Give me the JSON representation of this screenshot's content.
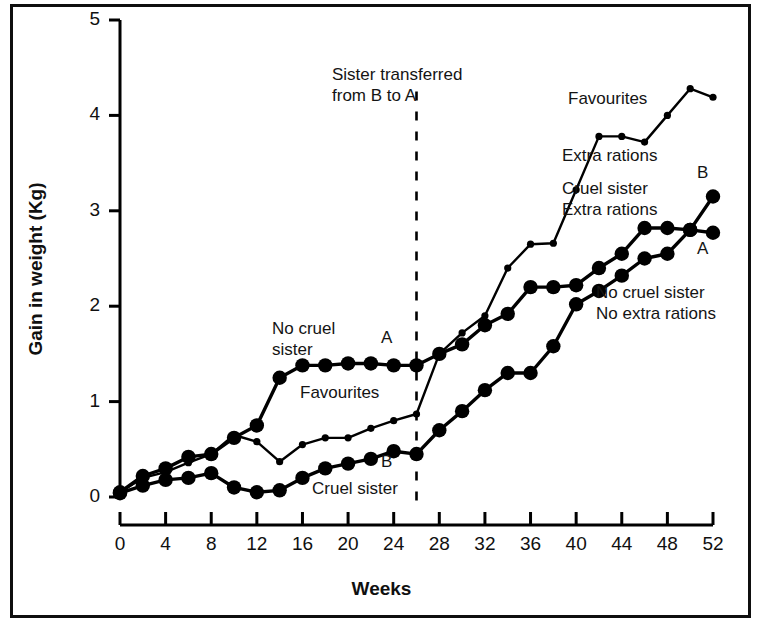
{
  "chart_data": {
    "type": "line",
    "title": "",
    "xlabel": "Weeks",
    "ylabel": "Gain in weight (Kg)",
    "xlim": [
      0,
      52
    ],
    "ylim": [
      0,
      5
    ],
    "xticks": [
      0,
      4,
      8,
      12,
      16,
      20,
      24,
      28,
      32,
      36,
      40,
      44,
      48,
      52
    ],
    "yticks": [
      0,
      1,
      2,
      3,
      4,
      5
    ],
    "grid": false,
    "legend_position": "inline-annotations",
    "marker_color": "#000000",
    "line_color": "#000000",
    "series": [
      {
        "name": "Favourites / Extra rations",
        "marker": "small-dot",
        "x": [
          0,
          2,
          4,
          6,
          8,
          10,
          12,
          14,
          16,
          18,
          20,
          22,
          24,
          26,
          28,
          30,
          32,
          34,
          36,
          38,
          40,
          42,
          44,
          46,
          48,
          50,
          52
        ],
        "y": [
          0.05,
          0.2,
          0.26,
          0.36,
          0.45,
          0.65,
          0.58,
          0.37,
          0.55,
          0.62,
          0.62,
          0.72,
          0.8,
          0.87,
          1.5,
          1.72,
          1.9,
          2.4,
          2.65,
          2.66,
          3.22,
          3.78,
          3.78,
          3.72,
          4.0,
          4.28,
          4.19
        ]
      },
      {
        "name": "A — No cruel sister (then cruel sister, extra rations)",
        "marker": "large-dot",
        "endpoint_label": "A",
        "x": [
          0,
          2,
          4,
          6,
          8,
          10,
          12,
          14,
          16,
          18,
          20,
          22,
          24,
          26,
          28,
          30,
          32,
          34,
          36,
          38,
          40,
          42,
          44,
          46,
          48,
          50,
          52
        ],
        "y": [
          0.05,
          0.22,
          0.3,
          0.42,
          0.45,
          0.62,
          0.75,
          1.25,
          1.38,
          1.38,
          1.4,
          1.4,
          1.38,
          1.38,
          1.5,
          1.6,
          1.8,
          1.92,
          2.2,
          2.2,
          2.22,
          2.4,
          2.55,
          2.82,
          2.82,
          2.8,
          2.77
        ]
      },
      {
        "name": "B — Cruel sister (then no cruel sister, no extra rations)",
        "marker": "large-dot",
        "endpoint_label": "B",
        "x": [
          0,
          2,
          4,
          6,
          8,
          10,
          12,
          14,
          16,
          18,
          20,
          22,
          24,
          26,
          28,
          30,
          32,
          34,
          36,
          38,
          40,
          42,
          44,
          46,
          48,
          50,
          52
        ],
        "y": [
          0.04,
          0.12,
          0.18,
          0.2,
          0.25,
          0.1,
          0.05,
          0.07,
          0.2,
          0.3,
          0.35,
          0.4,
          0.48,
          0.45,
          0.7,
          0.9,
          1.12,
          1.3,
          1.3,
          1.58,
          2.02,
          2.16,
          2.32,
          2.5,
          2.55,
          2.8,
          3.15
        ]
      }
    ],
    "annotations": [
      {
        "id": "transfer-note",
        "text": "Sister transferred\nfrom B to A",
        "x": 26,
        "y": 4.6
      },
      {
        "id": "no-cruel-sister",
        "text": "No cruel\nsister",
        "x": 15,
        "y": 1.75
      },
      {
        "id": "favourites-left",
        "text": "Favourites",
        "x": 17.5,
        "y": 1.05
      },
      {
        "id": "cruel-sister-left",
        "text": "Cruel sister",
        "x": 20,
        "y": 0.1
      },
      {
        "id": "favourites-right",
        "text": "Favourites",
        "x": 41,
        "y": 4.05
      },
      {
        "id": "extra-rations-right",
        "text": "Extra rations",
        "x": 41,
        "y": 3.45
      },
      {
        "id": "cruel-sister-extra-rations",
        "text": "Cruel sister\nExtra rations",
        "x": 41,
        "y": 3.05
      },
      {
        "id": "no-cruel-no-extra",
        "text": "No cruel sister\nNo extra rations",
        "x": 41,
        "y": 1.85
      }
    ],
    "reference_lines": [
      {
        "id": "transfer-line",
        "orientation": "vertical",
        "x": 26,
        "style": "dashed",
        "color": "#000000"
      }
    ],
    "point_labels": [
      {
        "id": "label-A-mid",
        "text": "A",
        "x": 24.4,
        "y": 1.62
      },
      {
        "id": "label-B-mid",
        "text": "B",
        "x": 24.4,
        "y": 0.25
      },
      {
        "id": "label-B-end",
        "text": "B",
        "x": 52.2,
        "y": 3.45
      },
      {
        "id": "label-A-end",
        "text": "A",
        "x": 52.2,
        "y": 2.45
      }
    ]
  },
  "axis": {
    "y_title": "Gain in weight (Kg)",
    "x_title": "Weeks",
    "y_tick_labels": [
      "0",
      "1",
      "2",
      "3",
      "4",
      "5"
    ],
    "x_tick_labels": [
      "0",
      "4",
      "8",
      "12",
      "16",
      "20",
      "24",
      "28",
      "32",
      "36",
      "40",
      "44",
      "48",
      "52"
    ]
  },
  "annotations_text": {
    "transfer_note_line1": "Sister transferred",
    "transfer_note_line2": "from B to A",
    "no_cruel_line1": "No cruel",
    "no_cruel_line2": "sister",
    "favourites_left": "Favourites",
    "cruel_sister_left": "Cruel sister",
    "favourites_right": "Favourites",
    "extra_rations_right": "Extra rations",
    "cruel_sister_extra_line1": "Cruel sister",
    "cruel_sister_extra_line2": "Extra rations",
    "no_cruel_no_extra_line1": "No cruel sister",
    "no_cruel_no_extra_line2": "No extra rations",
    "label_A_mid": "A",
    "label_B_mid": "B",
    "label_B_end": "B",
    "label_A_end": "A"
  }
}
